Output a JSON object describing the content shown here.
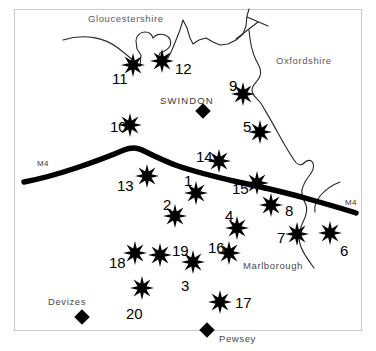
{
  "figure": {
    "type": "map",
    "title": "",
    "background_color": "#ffffff",
    "frame_color": "#c9c9c9",
    "marker_color": "#000000",
    "road_color": "#000000",
    "boundary_color": "#222222"
  },
  "county_labels": [
    {
      "text": "Gloucestershire",
      "x": 88,
      "y": 14
    },
    {
      "text": "Oxfordshire",
      "x": 276,
      "y": 56
    }
  ],
  "town_labels": [
    {
      "text": "SWINDON",
      "x": 160,
      "y": 96,
      "style": "caps"
    },
    {
      "text": "Marlborough",
      "x": 243,
      "y": 261,
      "style": "normal"
    },
    {
      "text": "Devizes",
      "x": 48,
      "y": 297,
      "style": "normal"
    },
    {
      "text": "Pewsey",
      "x": 219,
      "y": 334,
      "style": "normal"
    }
  ],
  "town_markers": [
    {
      "name": "swindon",
      "x": 203,
      "y": 111,
      "size": 11
    },
    {
      "name": "devizes",
      "x": 82,
      "y": 317,
      "size": 11
    },
    {
      "name": "pewsey",
      "x": 207,
      "y": 330,
      "size": 11
    }
  ],
  "road_labels": [
    {
      "text": "M4",
      "x": 37,
      "y": 160
    },
    {
      "text": "M4",
      "x": 345,
      "y": 199
    }
  ],
  "sites": [
    {
      "id": "1",
      "star_x": 196,
      "star_y": 193,
      "star_r": 12,
      "num_x": 184,
      "num_y": 173
    },
    {
      "id": "2",
      "star_x": 175,
      "star_y": 216,
      "star_r": 12,
      "num_x": 163,
      "num_y": 197
    },
    {
      "id": "3",
      "star_x": 193,
      "star_y": 262,
      "star_r": 12,
      "num_x": 181,
      "num_y": 278
    },
    {
      "id": "4",
      "star_x": 237,
      "star_y": 228,
      "star_r": 12,
      "num_x": 225,
      "num_y": 208
    },
    {
      "id": "5",
      "star_x": 260,
      "star_y": 132,
      "star_r": 12,
      "num_x": 243,
      "num_y": 119
    },
    {
      "id": "6",
      "star_x": 330,
      "star_y": 233,
      "star_r": 12,
      "num_x": 340,
      "num_y": 243
    },
    {
      "id": "7",
      "star_x": 297,
      "star_y": 234,
      "star_r": 12,
      "num_x": 277,
      "num_y": 230
    },
    {
      "id": "8",
      "star_x": 271,
      "star_y": 205,
      "star_r": 12,
      "num_x": 285,
      "num_y": 203
    },
    {
      "id": "9",
      "star_x": 243,
      "star_y": 94,
      "star_r": 12,
      "num_x": 229,
      "num_y": 78
    },
    {
      "id": "10",
      "star_x": 130,
      "star_y": 125,
      "star_r": 12,
      "num_x": 110,
      "num_y": 119
    },
    {
      "id": "11",
      "star_x": 133,
      "star_y": 65,
      "star_r": 12,
      "num_x": 112,
      "num_y": 71
    },
    {
      "id": "12",
      "star_x": 162,
      "star_y": 61,
      "star_r": 12,
      "num_x": 175,
      "num_y": 61
    },
    {
      "id": "13",
      "star_x": 147,
      "star_y": 176,
      "star_r": 12,
      "num_x": 117,
      "num_y": 178
    },
    {
      "id": "14",
      "star_x": 219,
      "star_y": 161,
      "star_r": 12,
      "num_x": 196,
      "num_y": 149
    },
    {
      "id": "15",
      "star_x": 257,
      "star_y": 183,
      "star_r": 12,
      "num_x": 232,
      "num_y": 181
    },
    {
      "id": "16",
      "star_x": 229,
      "star_y": 253,
      "star_r": 12,
      "num_x": 208,
      "num_y": 240
    },
    {
      "id": "17",
      "star_x": 220,
      "star_y": 302,
      "star_r": 12,
      "num_x": 235,
      "num_y": 295
    },
    {
      "id": "18",
      "star_x": 135,
      "star_y": 253,
      "star_r": 12,
      "num_x": 109,
      "num_y": 255
    },
    {
      "id": "19",
      "star_x": 160,
      "star_y": 255,
      "star_r": 12,
      "num_x": 172,
      "num_y": 243
    },
    {
      "id": "20",
      "star_x": 142,
      "star_y": 288,
      "star_r": 12,
      "num_x": 126,
      "num_y": 306
    }
  ],
  "chart_data": {
    "type": "map",
    "site_count": 20,
    "site_ids": [
      "1",
      "2",
      "3",
      "4",
      "5",
      "6",
      "7",
      "8",
      "9",
      "10",
      "11",
      "12",
      "13",
      "14",
      "15",
      "16",
      "17",
      "18",
      "19",
      "20"
    ],
    "towns": [
      "SWINDON",
      "Marlborough",
      "Devizes",
      "Pewsey"
    ],
    "counties": [
      "Gloucestershire",
      "Oxfordshire"
    ],
    "roads": [
      "M4"
    ],
    "legend": "none"
  }
}
